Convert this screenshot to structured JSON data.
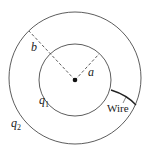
{
  "diagram": {
    "labels": {
      "b": "b",
      "a": "a",
      "q1": "q",
      "q1_sub": "1",
      "q2": "q",
      "q2_sub": "2",
      "wire": "Wire"
    },
    "colors": {
      "stroke": "#222222",
      "background": "#ffffff"
    }
  }
}
